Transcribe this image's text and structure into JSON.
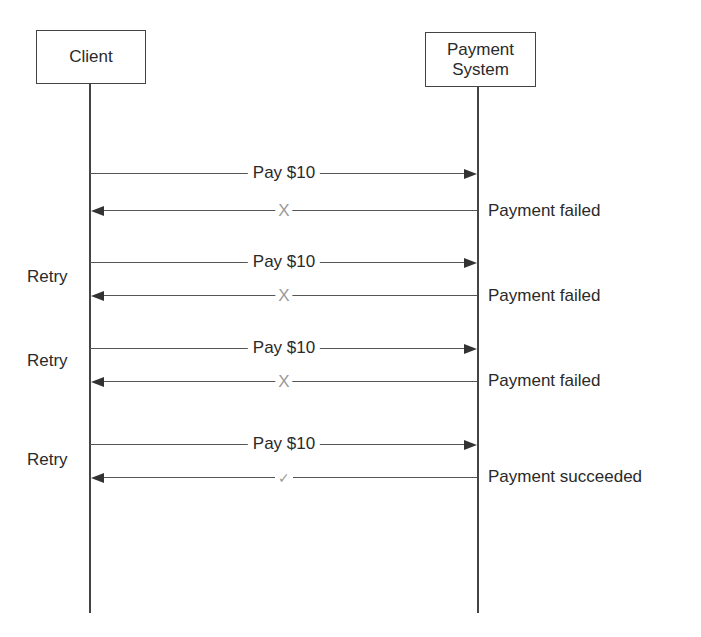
{
  "diagram": {
    "type": "sequence",
    "participants": [
      {
        "id": "client",
        "label": "Client"
      },
      {
        "id": "payment_system",
        "label": "Payment\nSystem",
        "label_line1": "Payment",
        "label_line2": "System"
      }
    ],
    "exchanges": [
      {
        "request": "Pay $10",
        "response_mark": "X",
        "response_status": "Payment failed",
        "retry_label": ""
      },
      {
        "request": "Pay $10",
        "response_mark": "X",
        "response_status": "Payment failed",
        "retry_label": "Retry"
      },
      {
        "request": "Pay $10",
        "response_mark": "X",
        "response_status": "Payment failed",
        "retry_label": "Retry"
      },
      {
        "request": "Pay $10",
        "response_mark": "✓",
        "response_status": "Payment succeeded",
        "retry_label": "Retry"
      }
    ],
    "colors": {
      "line": "#444444",
      "text": "#2a2a2a",
      "mark": "#9a9a9a"
    }
  }
}
